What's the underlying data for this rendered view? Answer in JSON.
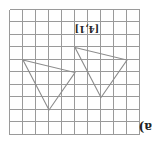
{
  "figure": {
    "part_label": "a)",
    "translation_vector": "[4,1]",
    "orientation": "rotated 180 degrees",
    "grid": {
      "cols": 10,
      "rows": 10,
      "line_color": "#9a9a9a"
    },
    "triangle_color": "#8c8c8c",
    "triangles": [
      {
        "name": "original",
        "vertices": [
          [
            1,
            4
          ],
          [
            5,
            5
          ],
          [
            3,
            8
          ]
        ]
      },
      {
        "name": "image",
        "vertices": [
          [
            5,
            3
          ],
          [
            9,
            4
          ],
          [
            7,
            7
          ]
        ]
      }
    ]
  }
}
